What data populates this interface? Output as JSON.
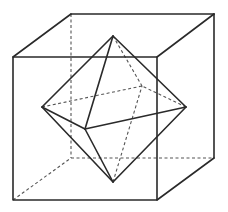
{
  "diagram": {
    "title": "",
    "colors": {
      "line": "#2a2a2a",
      "hidden_line": "#555555",
      "background": "#ffffff"
    },
    "shapes": [
      {
        "name": "cube",
        "visible_edges": 9,
        "hidden_edges": 3
      },
      {
        "name": "octahedron",
        "visible_edges": 8,
        "hidden_edges": 4
      }
    ]
  }
}
